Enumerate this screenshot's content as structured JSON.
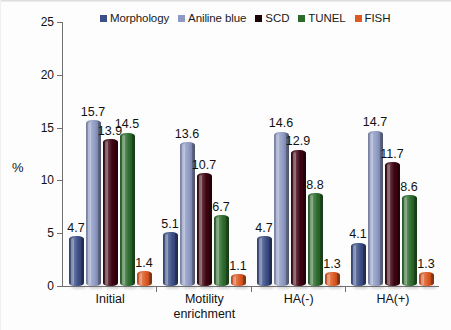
{
  "chart_data": {
    "type": "bar",
    "title": "",
    "subtitle": "",
    "xlabel": "",
    "ylabel": "%",
    "ylim": [
      0,
      25
    ],
    "yticks": [
      0,
      5,
      10,
      15,
      20,
      25
    ],
    "ytick_labels": [
      "0",
      "5",
      "10",
      "15",
      "20",
      "25"
    ],
    "grid": false,
    "legend_position": "top-center",
    "value_labels": true,
    "categories": [
      "Initial",
      "Motility\nenrichment",
      "HA(-)",
      "HA(+)"
    ],
    "series": [
      {
        "name": "Morphology",
        "color": "#3c4f86",
        "values": [
          4.7,
          5.1,
          4.7,
          4.1
        ],
        "labels": [
          "4.7",
          "5.1",
          "4.7",
          "4.1"
        ]
      },
      {
        "name": "Aniline blue",
        "color": "#8e9ac4",
        "values": [
          15.7,
          13.6,
          14.6,
          14.7
        ],
        "labels": [
          "15.7",
          "13.6",
          "14.6",
          "14.7"
        ]
      },
      {
        "name": "SCD",
        "color": "#3d0311",
        "values": [
          13.9,
          10.7,
          12.9,
          11.7
        ],
        "labels": [
          "13.9",
          "10.7",
          "12.9",
          "11.7"
        ]
      },
      {
        "name": "TUNEL",
        "color": "#2c6b2c",
        "values": [
          14.5,
          6.7,
          8.8,
          8.6
        ],
        "labels": [
          "14.5",
          "6.7",
          "8.8",
          "8.6"
        ]
      },
      {
        "name": "FISH",
        "color": "#dd5822",
        "values": [
          1.4,
          1.1,
          1.3,
          1.3
        ],
        "labels": [
          "1.4",
          "1.1",
          "1.3",
          "1.3"
        ]
      }
    ]
  },
  "legend": {
    "items": [
      {
        "label": "Morphology",
        "color": "#3c4f86"
      },
      {
        "label": "Aniline blue",
        "color": "#8e9ac4"
      },
      {
        "label": "SCD",
        "color": "#1a0207"
      },
      {
        "label": "TUNEL",
        "color": "#2c6b2c"
      },
      {
        "label": "FISH",
        "color": "#dd5822"
      }
    ]
  },
  "axes": {
    "y_title": "%",
    "y_tick_labels": [
      "25",
      "20",
      "15",
      "10",
      "5",
      "0"
    ],
    "x_tick_labels": [
      "Initial",
      "Motility\nenrichment",
      "HA(-)",
      "HA(+)"
    ]
  }
}
